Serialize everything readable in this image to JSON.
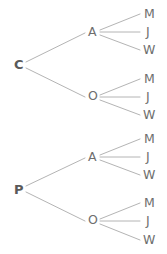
{
  "diagram": {
    "type": "tree",
    "orientation": "left-to-right",
    "background_color": "#ffffff",
    "edge_color": "#b4b4b4",
    "text_color": "#6e6e6e",
    "levels": 3,
    "nodes": {
      "root_1": "C",
      "root_2": "P",
      "mid_1": "A",
      "mid_2": "O",
      "mid_3": "A",
      "mid_4": "O",
      "leaf_1": "M",
      "leaf_2": "J",
      "leaf_3": "W",
      "leaf_4": "M",
      "leaf_5": "J",
      "leaf_6": "W",
      "leaf_7": "M",
      "leaf_8": "J",
      "leaf_9": "W",
      "leaf_10": "M",
      "leaf_11": "J",
      "leaf_12": "W"
    },
    "structure": [
      {
        "label": "C",
        "children": [
          {
            "label": "A",
            "children": [
              {
                "label": "M"
              },
              {
                "label": "J"
              },
              {
                "label": "W"
              }
            ]
          },
          {
            "label": "O",
            "children": [
              {
                "label": "M"
              },
              {
                "label": "J"
              },
              {
                "label": "W"
              }
            ]
          }
        ]
      },
      {
        "label": "P",
        "children": [
          {
            "label": "A",
            "children": [
              {
                "label": "M"
              },
              {
                "label": "J"
              },
              {
                "label": "W"
              }
            ]
          },
          {
            "label": "O",
            "children": [
              {
                "label": "M"
              },
              {
                "label": "J"
              },
              {
                "label": "W"
              }
            ]
          }
        ]
      }
    ]
  }
}
